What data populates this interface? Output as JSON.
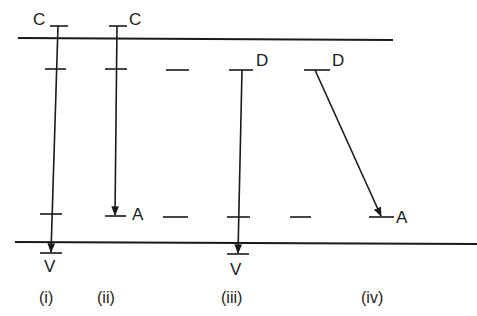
{
  "diagram": {
    "type": "energy-level transitions",
    "levels": {
      "top_boundary_y": 40,
      "bottom_boundary_y": 243
    },
    "columns": [
      {
        "caption": "(i)",
        "top_label": "C",
        "bottom_label": "V",
        "transition": "C → V"
      },
      {
        "caption": "(ii)",
        "top_label": "C",
        "bottom_label": "A",
        "transition": "C → A"
      },
      {
        "caption": "(iii)",
        "top_label": "D",
        "bottom_label": "V",
        "transition": "D → V"
      },
      {
        "caption": "(iv)",
        "top_label": "D",
        "bottom_label": "A",
        "transition": "D → A"
      }
    ]
  }
}
